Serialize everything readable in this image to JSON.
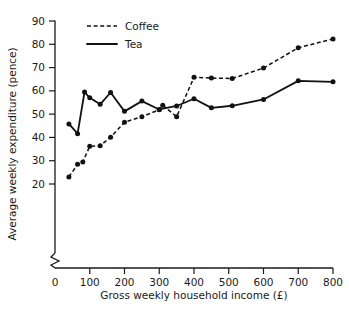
{
  "chart_data": {
    "type": "line",
    "title": "",
    "xlabel": "Gross weekly household income (£)",
    "ylabel": "Average weekly expenditure (pence)",
    "xlim": [
      0,
      800
    ],
    "ylim": [
      20,
      90
    ],
    "y_axis_break": true,
    "grid": false,
    "legend_position": "top-left-inside",
    "x_ticks": [
      "0",
      "100",
      "200",
      "300",
      "400",
      "500",
      "600",
      "700",
      "800"
    ],
    "y_ticks": [
      "20",
      "30",
      "40",
      "50",
      "60",
      "70",
      "80",
      "90"
    ],
    "series": [
      {
        "name": "Coffee",
        "style": "dashed",
        "marker": "filled-circle",
        "color": "#111111",
        "x": [
          40,
          65,
          80,
          100,
          130,
          160,
          200,
          250,
          300,
          310,
          350,
          400,
          450,
          510,
          600,
          700,
          800
        ],
        "values": [
          23.0,
          28.5,
          29.5,
          36.2,
          36.4,
          40.1,
          46.5,
          48.9,
          51.9,
          53.8,
          48.9,
          65.8,
          65.5,
          65.3,
          69.8,
          78.5,
          82.3
        ]
      },
      {
        "name": "Tea",
        "style": "solid",
        "marker": "filled-circle",
        "color": "#111111",
        "x": [
          40,
          65,
          85,
          100,
          130,
          160,
          200,
          250,
          300,
          350,
          400,
          450,
          510,
          600,
          700,
          800
        ],
        "values": [
          45.8,
          41.6,
          59.5,
          57.0,
          54.2,
          59.3,
          51.2,
          55.6,
          52.0,
          53.5,
          56.6,
          52.7,
          53.6,
          56.3,
          64.3,
          63.9
        ]
      }
    ]
  },
  "legend": {
    "entries": [
      {
        "label": "Coffee",
        "style": "dashed"
      },
      {
        "label": "Tea",
        "style": "solid"
      }
    ]
  },
  "axes": {
    "x_title": "Gross weekly household income (£)",
    "y_title": "Average weekly expenditure (pence)"
  }
}
